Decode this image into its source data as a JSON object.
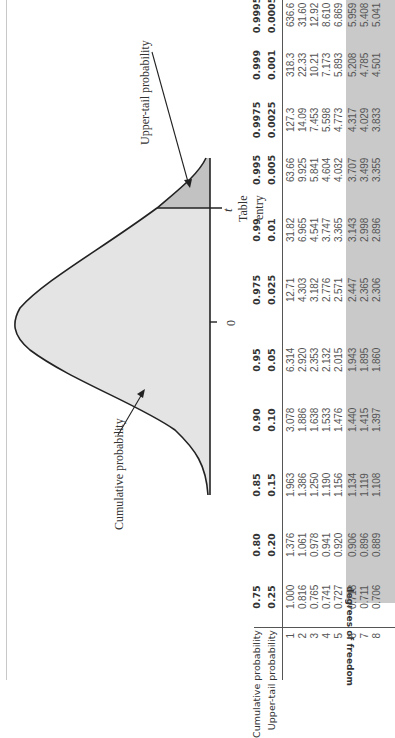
{
  "figure": {
    "cumulative_label": "Cumulative probability",
    "upper_tail_label": "Upper-tail probability",
    "zero_label": "0",
    "t_label": "t",
    "table_entry_line1": "Table",
    "table_entry_line2": "entry",
    "colors": {
      "cumulative_fill": "#e4e4e4",
      "upper_tail_fill": "#c2c2c2",
      "curve_stroke": "#222222"
    }
  },
  "table": {
    "row_label_cumulative": "Cumulative probability",
    "row_label_upper_tail": "Upper-tail probability",
    "df_label": "degrees of freedom",
    "shade_color": "#c9c9c9",
    "columns": [
      {
        "cum": "0.75",
        "tail": "0.25"
      },
      {
        "cum": "0.80",
        "tail": "0.20"
      },
      {
        "cum": "0.85",
        "tail": "0.15"
      },
      {
        "cum": "0.90",
        "tail": "0.10"
      },
      {
        "cum": "0.95",
        "tail": "0.05"
      },
      {
        "cum": "0.975",
        "tail": "0.025"
      },
      {
        "cum": "0.99",
        "tail": "0.01"
      },
      {
        "cum": "0.995",
        "tail": "0.005"
      },
      {
        "cum": "0.9975",
        "tail": "0.0025"
      },
      {
        "cum": "0.999",
        "tail": "0.001"
      },
      {
        "cum": "0.9995",
        "tail": "0.0005"
      }
    ],
    "rows": [
      {
        "df": "1",
        "values": [
          "1.000",
          "1.376",
          "1.963",
          "3.078",
          "6.314",
          "12.71",
          "31.82",
          "63.66",
          "127.3",
          "318.3",
          "636.6"
        ]
      },
      {
        "df": "2",
        "values": [
          "0.816",
          "1.061",
          "1.386",
          "1.886",
          "2.920",
          "4.303",
          "6.965",
          "9.925",
          "14.09",
          "22.33",
          "31.60"
        ]
      },
      {
        "df": "3",
        "values": [
          "0.765",
          "0.978",
          "1.250",
          "1.638",
          "2.353",
          "3.182",
          "4.541",
          "5.841",
          "7.453",
          "10.21",
          "12.92"
        ]
      },
      {
        "df": "4",
        "values": [
          "0.741",
          "0.941",
          "1.190",
          "1.533",
          "2.132",
          "2.776",
          "3.747",
          "4.604",
          "5.598",
          "7.173",
          "8.610"
        ]
      },
      {
        "df": "5",
        "values": [
          "0.727",
          "0.920",
          "1.156",
          "1.476",
          "2.015",
          "2.571",
          "3.365",
          "4.032",
          "4.773",
          "5.893",
          "6.869"
        ]
      },
      {
        "df": "6",
        "values": [
          "0.718",
          "0.906",
          "1.134",
          "1.440",
          "1.943",
          "2.447",
          "3.143",
          "3.707",
          "4.317",
          "5.208",
          "5.959"
        ]
      },
      {
        "df": "7",
        "values": [
          "0.711",
          "0.896",
          "1.119",
          "1.415",
          "1.895",
          "2.365",
          "2.998",
          "3.499",
          "4.029",
          "4.785",
          "5.408"
        ]
      },
      {
        "df": "8",
        "values": [
          "0.706",
          "0.889",
          "1.108",
          "1.397",
          "1.860",
          "2.306",
          "2.896",
          "3.355",
          "3.833",
          "4.501",
          "5.041"
        ]
      }
    ]
  }
}
